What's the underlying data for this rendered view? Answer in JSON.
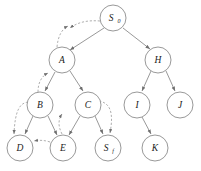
{
  "figure": {
    "type": "search-tree-diagram",
    "width": 201,
    "height": 171,
    "background": "#ffffff",
    "node_stroke": "#8d8d8d",
    "node_fill": "#ffffff",
    "label_color": "#1a1a1a",
    "solid_edge_color": "#8d8d8d",
    "dashed_edge_color": "#9a9a9a"
  },
  "nodes": [
    {
      "id": "S0",
      "label": "S",
      "sub": "0",
      "cx": 113,
      "cy": 18,
      "r": 13
    },
    {
      "id": "A",
      "label": "A",
      "sub": "",
      "cx": 62,
      "cy": 60,
      "r": 13
    },
    {
      "id": "H",
      "label": "H",
      "sub": "",
      "cx": 158,
      "cy": 60,
      "r": 13
    },
    {
      "id": "B",
      "label": "B",
      "sub": "",
      "cx": 40,
      "cy": 105,
      "r": 13
    },
    {
      "id": "C",
      "label": "C",
      "sub": "",
      "cx": 88,
      "cy": 105,
      "r": 13
    },
    {
      "id": "I",
      "label": "I",
      "sub": "",
      "cx": 137,
      "cy": 105,
      "r": 13
    },
    {
      "id": "J",
      "label": "J",
      "sub": "",
      "cx": 180,
      "cy": 105,
      "r": 13
    },
    {
      "id": "D",
      "label": "D",
      "sub": "",
      "cx": 20,
      "cy": 148,
      "r": 13
    },
    {
      "id": "E",
      "label": "E",
      "sub": "",
      "cx": 63,
      "cy": 148,
      "r": 13
    },
    {
      "id": "Sf",
      "label": "S",
      "sub": "f",
      "cx": 108,
      "cy": 148,
      "r": 13
    },
    {
      "id": "K",
      "label": "K",
      "sub": "",
      "cx": 155,
      "cy": 148,
      "r": 13
    }
  ],
  "tree_edges": [
    {
      "from": "S0",
      "to": "A",
      "style": "solid",
      "arrow": true
    },
    {
      "from": "S0",
      "to": "H",
      "style": "solid",
      "arrow": true
    },
    {
      "from": "A",
      "to": "B",
      "style": "solid",
      "arrow": true
    },
    {
      "from": "A",
      "to": "C",
      "style": "solid",
      "arrow": true
    },
    {
      "from": "B",
      "to": "D",
      "style": "solid",
      "arrow": true
    },
    {
      "from": "B",
      "to": "E",
      "style": "solid",
      "arrow": true
    },
    {
      "from": "C",
      "to": "E",
      "style": "solid",
      "arrow": true
    },
    {
      "from": "C",
      "to": "Sf",
      "style": "solid",
      "arrow": true
    },
    {
      "from": "H",
      "to": "I",
      "style": "solid",
      "arrow": true
    },
    {
      "from": "H",
      "to": "J",
      "style": "solid",
      "arrow": true
    },
    {
      "from": "I",
      "to": "K",
      "style": "solid",
      "arrow": true
    }
  ],
  "backtrack_edges": [
    {
      "id": "bt-s0-up",
      "from": "S0",
      "to": "above-left",
      "style": "dashed",
      "arrow": true
    },
    {
      "id": "bt-a-s0",
      "from": "A",
      "to": "S0",
      "style": "dashed",
      "arrow": true
    },
    {
      "id": "bt-b-a",
      "from": "B",
      "to": "A",
      "style": "dashed",
      "arrow": true
    },
    {
      "id": "bt-b-left",
      "from": "B",
      "to": "D",
      "style": "dashed",
      "arrow": true
    },
    {
      "id": "bt-e-d",
      "from": "E",
      "to": "D",
      "style": "dashed",
      "arrow": true
    },
    {
      "id": "bt-c-sf",
      "from": "C",
      "to": "Sf",
      "style": "dashed",
      "arrow": true
    },
    {
      "id": "bt-e-up",
      "from": "E",
      "to": "C",
      "style": "dashed",
      "arrow": true
    }
  ]
}
